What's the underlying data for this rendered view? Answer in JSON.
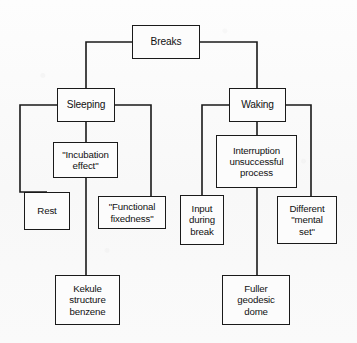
{
  "diagram": {
    "type": "tree-diagram",
    "title_text": "Breaks",
    "line_color": "#1a1a1a",
    "box_fill": "#fcfcfc",
    "background_color": "#fbfbfb",
    "nodes": [
      {
        "id": "breaks",
        "label": "Breaks",
        "x": 132,
        "y": 25,
        "w": 68,
        "h": 34
      },
      {
        "id": "sleeping",
        "label": "Sleeping",
        "x": 57,
        "y": 88,
        "w": 58,
        "h": 34
      },
      {
        "id": "waking",
        "label": "Waking",
        "x": 229,
        "y": 88,
        "w": 57,
        "h": 34
      },
      {
        "id": "incubation",
        "label": "\"Incubation\neffect\"",
        "x": 53,
        "y": 142,
        "w": 65,
        "h": 36
      },
      {
        "id": "interruption",
        "label": "Interruption\nunsuccessful\nprocess",
        "x": 216,
        "y": 135,
        "w": 81,
        "h": 53
      },
      {
        "id": "rest",
        "label": "Rest",
        "x": 24,
        "y": 192,
        "w": 46,
        "h": 38
      },
      {
        "id": "functional",
        "label": "\"Functional\nfixedness\"",
        "x": 98,
        "y": 196,
        "w": 68,
        "h": 33
      },
      {
        "id": "input",
        "label": "Input\nduring\nbreak",
        "x": 180,
        "y": 195,
        "w": 44,
        "h": 50
      },
      {
        "id": "different",
        "label": "Different\n\"mental\nset\"",
        "x": 277,
        "y": 196,
        "w": 60,
        "h": 48
      },
      {
        "id": "kekule",
        "label": "Kekule\nstructure\nbenzene",
        "x": 55,
        "y": 275,
        "w": 65,
        "h": 50
      },
      {
        "id": "fuller",
        "label": "Fuller\ngeodesic\ndome",
        "x": 222,
        "y": 275,
        "w": 68,
        "h": 50
      }
    ],
    "edges": [
      {
        "id": "breaks-to-sleeping",
        "from": "breaks",
        "to": "sleeping",
        "points": "132,42 86,42 86,88"
      },
      {
        "id": "breaks-to-waking",
        "from": "breaks",
        "to": "waking",
        "points": "200,42 257,42 257,88"
      },
      {
        "id": "sleeping-to-incubation",
        "from": "sleeping",
        "to": "incubation",
        "points": "86,122 86,142"
      },
      {
        "id": "sleeping-to-rest",
        "from": "sleeping",
        "to": "rest",
        "points": "57,105 20,105 20,192 47,192"
      },
      {
        "id": "sleeping-to-functional",
        "from": "sleeping",
        "to": "functional",
        "points": "115,105 151,105 151,196"
      },
      {
        "id": "incubation-to-kekule",
        "from": "incubation",
        "to": "kekule",
        "points": "86,178 86,275"
      },
      {
        "id": "waking-to-interruption",
        "from": "waking",
        "to": "interruption",
        "points": "257,122 257,135"
      },
      {
        "id": "waking-to-input",
        "from": "waking",
        "to": "input",
        "points": "229,105 202,105 202,195"
      },
      {
        "id": "waking-to-different",
        "from": "waking",
        "to": "different",
        "points": "286,105 311,105 311,196"
      },
      {
        "id": "interruption-to-fuller",
        "from": "interruption",
        "to": "fuller",
        "points": "257,188 257,275"
      }
    ]
  }
}
